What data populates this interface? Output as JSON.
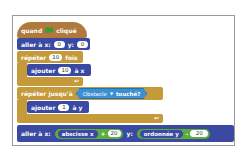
{
  "script": {
    "hat": {
      "label_when": "quand",
      "icon": "green-flag-icon",
      "label_clicked": "cliqué"
    },
    "goto1": {
      "label": "aller à x:",
      "x": "0",
      "label_y": "y:",
      "y": "0"
    },
    "repeat": {
      "label": "répéter",
      "count": "10",
      "label_times": "fois",
      "inner": {
        "label": "ajouter",
        "value": "10",
        "label_to": "à x"
      }
    },
    "repeat_until": {
      "label": "répéter jusqu'à",
      "condition": {
        "target": "Obstacle",
        "label": "touché?"
      },
      "inner": {
        "label": "ajouter",
        "value": "1",
        "label_to": "à y"
      }
    },
    "goto2": {
      "label": "aller à x:",
      "x_expr": {
        "reporter": "abscisse x",
        "op": "+",
        "value": "20"
      },
      "label_y": "y:",
      "y_expr": {
        "reporter": "ordonnée y",
        "op": "-",
        "value": "20"
      }
    }
  },
  "colors": {
    "motion": "#3a4aa2",
    "control": "#c49a3a",
    "events": "#b07a3c",
    "operators": "#5aae3a",
    "sensing": "#3d8fd4"
  }
}
